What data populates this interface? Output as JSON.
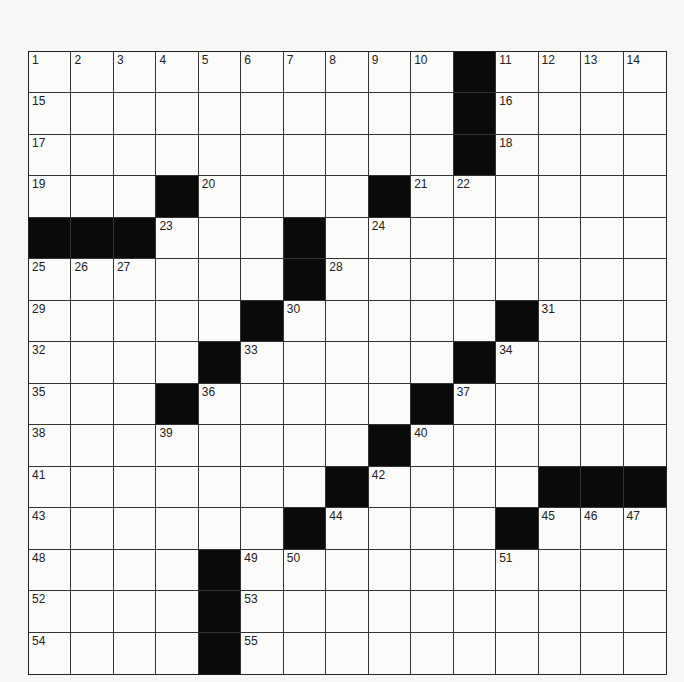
{
  "puzzle": {
    "type": "crossword",
    "size": {
      "rows": 15,
      "cols": 15
    },
    "grid": [
      "..........#....",
      "..........#....",
      "..........#....",
      "...#....#......",
      "###...#........",
      "......#........",
      ".....#.....#...",
      "....#.....#....",
      "...#.....#.....",
      "........#......",
      ".......#....###",
      "......#....#...",
      "....#..........",
      "....#..........",
      "....#.........."
    ],
    "numbers": [
      {
        "r": 0,
        "c": 0,
        "n": "1"
      },
      {
        "r": 0,
        "c": 1,
        "n": "2"
      },
      {
        "r": 0,
        "c": 2,
        "n": "3"
      },
      {
        "r": 0,
        "c": 3,
        "n": "4"
      },
      {
        "r": 0,
        "c": 4,
        "n": "5"
      },
      {
        "r": 0,
        "c": 5,
        "n": "6"
      },
      {
        "r": 0,
        "c": 6,
        "n": "7"
      },
      {
        "r": 0,
        "c": 7,
        "n": "8"
      },
      {
        "r": 0,
        "c": 8,
        "n": "9"
      },
      {
        "r": 0,
        "c": 9,
        "n": "10"
      },
      {
        "r": 0,
        "c": 11,
        "n": "11"
      },
      {
        "r": 0,
        "c": 12,
        "n": "12"
      },
      {
        "r": 0,
        "c": 13,
        "n": "13"
      },
      {
        "r": 0,
        "c": 14,
        "n": "14"
      },
      {
        "r": 1,
        "c": 0,
        "n": "15"
      },
      {
        "r": 1,
        "c": 11,
        "n": "16"
      },
      {
        "r": 2,
        "c": 0,
        "n": "17"
      },
      {
        "r": 2,
        "c": 11,
        "n": "18"
      },
      {
        "r": 3,
        "c": 0,
        "n": "19"
      },
      {
        "r": 3,
        "c": 4,
        "n": "20"
      },
      {
        "r": 3,
        "c": 9,
        "n": "21"
      },
      {
        "r": 3,
        "c": 10,
        "n": "22"
      },
      {
        "r": 4,
        "c": 3,
        "n": "23"
      },
      {
        "r": 4,
        "c": 8,
        "n": "24"
      },
      {
        "r": 5,
        "c": 0,
        "n": "25"
      },
      {
        "r": 5,
        "c": 1,
        "n": "26"
      },
      {
        "r": 5,
        "c": 2,
        "n": "27"
      },
      {
        "r": 5,
        "c": 7,
        "n": "28"
      },
      {
        "r": 6,
        "c": 0,
        "n": "29"
      },
      {
        "r": 6,
        "c": 6,
        "n": "30"
      },
      {
        "r": 6,
        "c": 12,
        "n": "31"
      },
      {
        "r": 7,
        "c": 0,
        "n": "32"
      },
      {
        "r": 7,
        "c": 5,
        "n": "33"
      },
      {
        "r": 7,
        "c": 11,
        "n": "34"
      },
      {
        "r": 8,
        "c": 0,
        "n": "35"
      },
      {
        "r": 8,
        "c": 4,
        "n": "36"
      },
      {
        "r": 8,
        "c": 10,
        "n": "37"
      },
      {
        "r": 9,
        "c": 0,
        "n": "38"
      },
      {
        "r": 9,
        "c": 3,
        "n": "39"
      },
      {
        "r": 9,
        "c": 9,
        "n": "40"
      },
      {
        "r": 10,
        "c": 0,
        "n": "41"
      },
      {
        "r": 10,
        "c": 8,
        "n": "42"
      },
      {
        "r": 11,
        "c": 0,
        "n": "43"
      },
      {
        "r": 11,
        "c": 7,
        "n": "44"
      },
      {
        "r": 11,
        "c": 12,
        "n": "45"
      },
      {
        "r": 11,
        "c": 13,
        "n": "46"
      },
      {
        "r": 11,
        "c": 14,
        "n": "47"
      },
      {
        "r": 12,
        "c": 0,
        "n": "48"
      },
      {
        "r": 12,
        "c": 5,
        "n": "49"
      },
      {
        "r": 12,
        "c": 6,
        "n": "50"
      },
      {
        "r": 12,
        "c": 11,
        "n": "51"
      },
      {
        "r": 13,
        "c": 0,
        "n": "52"
      },
      {
        "r": 13,
        "c": 5,
        "n": "53"
      },
      {
        "r": 14,
        "c": 0,
        "n": "54"
      },
      {
        "r": 14,
        "c": 5,
        "n": "55"
      }
    ],
    "colors": {
      "black_square": "#0a0a0a",
      "white_square": "#fbfbf9",
      "grid_line": "#333333"
    }
  }
}
